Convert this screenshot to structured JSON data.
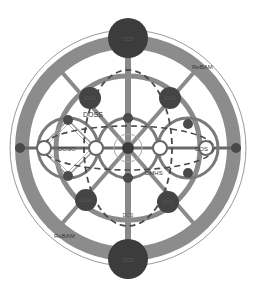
{
  "diagram": {
    "type": "radial network topology",
    "colors": {
      "ring": "#8a8a8a",
      "node_large": "#3c3c3c",
      "node_medium": "#444444",
      "node_small": "#4a4a4a",
      "line": "#7a7a7a",
      "dashed": "#4a4a4a",
      "outer_thin": "#9a9a9a"
    },
    "labels": {
      "rebam_top_right": "ReBAM",
      "rebam_bottom_left": "ReBAM",
      "doss": "DOSS",
      "doso": "DOSO",
      "dmhs": "DMHS",
      "dos_right": "DOS",
      "bottom_center": "DCS"
    },
    "nodes": {
      "top_large": "CCS",
      "bottom_large": "CCS",
      "upper_left": "CCU",
      "upper_right": "CCU",
      "lower_left": "CCU",
      "lower_right": "CCU"
    }
  }
}
